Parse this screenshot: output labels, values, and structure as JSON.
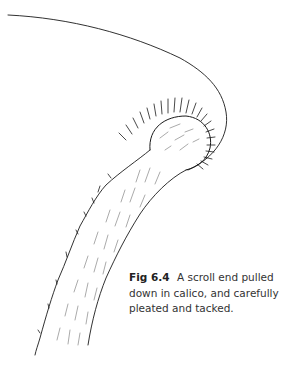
{
  "figure": {
    "label": "Fig 6.4",
    "caption": "A scroll end pulled down in calico, and carefully pleated and tacked.",
    "illustration": "scroll-end-drawing",
    "line_color": "#1a1a1a"
  }
}
